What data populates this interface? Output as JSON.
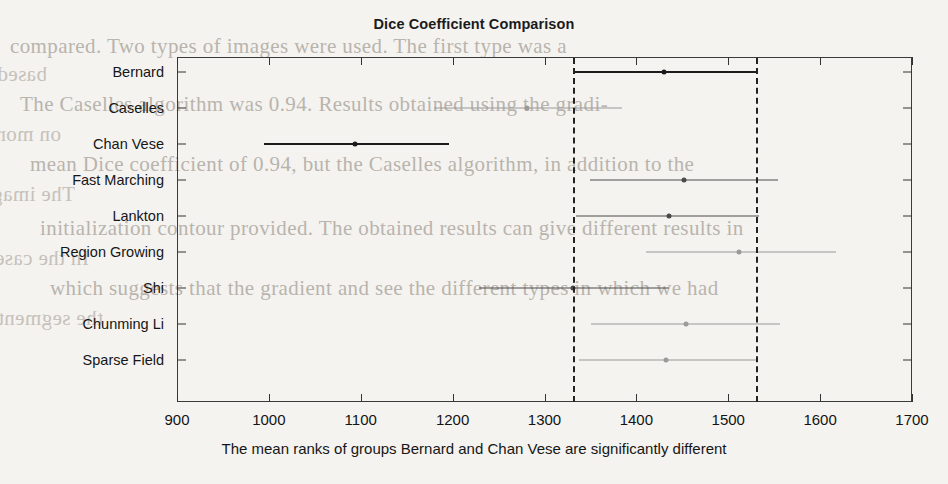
{
  "page": {
    "background_color": "#f4f3f0",
    "scan_bleed_text": [
      "compared. Two types of images were used. The first type was a",
      "based in the used and the maximum evaluated to see the obtained",
      "The Caselles algorithm was 0.94. Results obtained using the gradi-",
      "on more-carbohydrate method and region growing segmentation after",
      "mean Dice coefficient of 0.94, but the Caselles algorithm, in addition to the",
      "The image was reduced and was similar. One of the limitations of the unknown",
      "initialization contour provided. The obtained results can give different results in",
      "In the case of the gradient is used to far from the actual contour of",
      "which suggests that the gradient and see the different types in which we had",
      "the segmentation obtained by segmentation from the actual contour"
    ]
  },
  "chart_data": {
    "type": "interval",
    "title": "Dice Coefficient Comparison",
    "xlabel": "The mean ranks of groups Bernard and Chan Vese are significantly different",
    "ylabel": "",
    "xlim": [
      900,
      1700
    ],
    "xticks": [
      900,
      1000,
      1100,
      1200,
      1300,
      1400,
      1500,
      1600,
      1700
    ],
    "xtick_labels": [
      "900",
      "1000",
      "1100",
      "1200",
      "1300",
      "1400",
      "1500",
      "1600",
      "1700"
    ],
    "grid": false,
    "legend": "none",
    "reference_lines": [
      1331,
      1530
    ],
    "reference_group": "Bernard",
    "categories": [
      "Bernard",
      "Caselles",
      "Chan Vese",
      "Fast Marching",
      "Lankton",
      "Region Growing",
      "Shi",
      "Chunming Li",
      "Sparse Field"
    ],
    "series": [
      {
        "name": "Bernard",
        "mean_rank": 1430,
        "lower": 1331,
        "upper": 1530,
        "highlight": "reference",
        "color": "#1c1c1c"
      },
      {
        "name": "Caselles",
        "mean_rank": 1281,
        "lower": 1180,
        "upper": 1384,
        "highlight": "significant",
        "color": "#9a9a9a"
      },
      {
        "name": "Chan Vese",
        "mean_rank": 1094,
        "lower": 995,
        "upper": 1196,
        "highlight": "significant",
        "color": "#1c1c1c"
      },
      {
        "name": "Fast Marching",
        "mean_rank": 1452,
        "lower": 1350,
        "upper": 1554,
        "highlight": "none",
        "color": "#4a4a4a"
      },
      {
        "name": "Lankton",
        "mean_rank": 1436,
        "lower": 1334,
        "upper": 1534,
        "highlight": "none",
        "color": "#4a4a4a"
      },
      {
        "name": "Region Growing",
        "mean_rank": 1512,
        "lower": 1411,
        "upper": 1617,
        "highlight": "none",
        "color": "#9a9a9a"
      },
      {
        "name": "Shi",
        "mean_rank": 1331,
        "lower": 1229,
        "upper": 1435,
        "highlight": "none",
        "color": "#4a4a4a"
      },
      {
        "name": "Chunming Li",
        "mean_rank": 1454,
        "lower": 1351,
        "upper": 1556,
        "highlight": "none",
        "color": "#9a9a9a"
      },
      {
        "name": "Sparse Field",
        "mean_rank": 1432,
        "lower": 1338,
        "upper": 1531,
        "highlight": "none",
        "color": "#9a9a9a"
      }
    ]
  }
}
